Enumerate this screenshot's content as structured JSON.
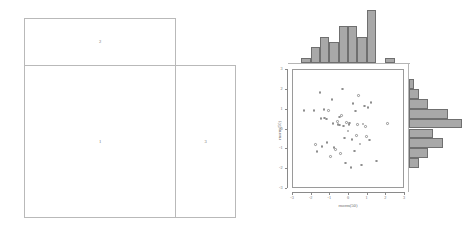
{
  "layout_diagram": {
    "title": "layout-matrix-diagram",
    "cells": [
      {
        "id": "1",
        "label": "1",
        "role": "scatter-region"
      },
      {
        "id": "2",
        "label": "2",
        "role": "top-histogram-region"
      },
      {
        "id": "3",
        "label": "3",
        "role": "right-histogram-region"
      }
    ],
    "border_color": "#b9b9b9",
    "label_color": "#6d6d6d"
  },
  "chart_data": {
    "type": "scatter",
    "title": "",
    "subtitle": "",
    "xlabel": "rnorm(50)",
    "ylabel": "rnorm(50)",
    "xlim": [
      -3,
      3
    ],
    "ylim": [
      -3,
      3
    ],
    "xticks": [
      "-3",
      "-2",
      "-1",
      "0",
      "1",
      "2",
      "3"
    ],
    "xtick_values": [
      -3,
      -2,
      -1,
      0,
      1,
      2,
      3
    ],
    "yticks": [
      "-3",
      "-2",
      "-1",
      "0",
      "1",
      "2",
      "3"
    ],
    "ytick_values": [
      -3,
      -2,
      -1,
      0,
      1,
      2,
      3
    ],
    "grid": false,
    "legend": null,
    "point_style": {
      "marker": "open-circle",
      "color": "#8e8e8e",
      "size": 2.6
    },
    "n_points": 50,
    "points": [
      [
        -2.42,
        0.96
      ],
      [
        -1.88,
        0.95
      ],
      [
        -1.78,
        -0.75
      ],
      [
        -1.72,
        -1.12
      ],
      [
        -1.55,
        1.88
      ],
      [
        -1.5,
        0.56
      ],
      [
        -1.44,
        -0.85
      ],
      [
        -1.33,
        1.02
      ],
      [
        -1.3,
        0.58
      ],
      [
        -1.22,
        0.52
      ],
      [
        -1.18,
        -0.66
      ],
      [
        -1.1,
        0.97
      ],
      [
        -0.98,
        -1.35
      ],
      [
        -0.9,
        1.52
      ],
      [
        -0.86,
        0.3
      ],
      [
        -0.8,
        -0.9
      ],
      [
        -0.72,
        -1.02
      ],
      [
        -0.62,
        0.4
      ],
      [
        -0.58,
        0.26
      ],
      [
        -0.52,
        0.22
      ],
      [
        -0.5,
        0.62
      ],
      [
        -0.46,
        -1.22
      ],
      [
        -0.4,
        0.7
      ],
      [
        -0.34,
        2.05
      ],
      [
        -0.3,
        0.18
      ],
      [
        -0.24,
        -0.42
      ],
      [
        -0.18,
        -1.68
      ],
      [
        -0.12,
        0.36
      ],
      [
        -0.06,
        -0.08
      ],
      [
        0.0,
        0.26
      ],
      [
        0.04,
        0.32
      ],
      [
        0.1,
        -1.92
      ],
      [
        0.16,
        -0.5
      ],
      [
        0.22,
        1.3
      ],
      [
        0.28,
        -1.08
      ],
      [
        0.34,
        0.94
      ],
      [
        0.4,
        -0.3
      ],
      [
        0.46,
        0.24
      ],
      [
        0.52,
        1.7
      ],
      [
        0.58,
        -0.74
      ],
      [
        0.66,
        -1.8
      ],
      [
        0.74,
        0.28
      ],
      [
        0.82,
        1.18
      ],
      [
        0.88,
        0.14
      ],
      [
        0.94,
        -0.34
      ],
      [
        1.02,
        1.1
      ],
      [
        1.1,
        -0.52
      ],
      [
        1.18,
        1.36
      ],
      [
        1.46,
        -1.58
      ],
      [
        2.06,
        0.3
      ]
    ],
    "marginal_top": {
      "type": "bar",
      "orientation": "vertical",
      "label": "x-marginal-histogram",
      "bin_edges": [
        -3.0,
        -2.5,
        -2.0,
        -1.5,
        -1.0,
        -0.5,
        0.0,
        0.5,
        1.0,
        1.5,
        2.0,
        2.5
      ],
      "categories": [
        "-3:-2.5",
        "-2.5:-2",
        "-2:-1.5",
        "-1.5:-1",
        "-1:-0.5",
        "-0.5:0",
        "0:0.5",
        "0.5:1",
        "1:1.5",
        "1.5:2",
        "2:2.5"
      ],
      "values": [
        0,
        1,
        3,
        5,
        4,
        7,
        7,
        5,
        10,
        0,
        1
      ],
      "ylim": [
        0,
        10
      ]
    },
    "marginal_right": {
      "type": "bar",
      "orientation": "horizontal",
      "label": "y-marginal-histogram",
      "bin_edges": [
        -2.0,
        -1.5,
        -1.0,
        -0.5,
        0.0,
        0.5,
        1.0,
        1.5,
        2.0,
        2.5
      ],
      "categories": [
        "2:2.5",
        "1.5:2",
        "1:1.5",
        "0.5:1",
        "0:0.5",
        "-0.5:0",
        "-1:-0.5",
        "-1.5:-1",
        "-2:-1.5"
      ],
      "values": [
        1,
        2,
        4,
        8,
        11,
        5,
        7,
        4,
        2
      ],
      "xlim": [
        0,
        11
      ]
    },
    "bar_style": {
      "fill": "#a8a8a8",
      "border": "#6f6f6f"
    },
    "axis_color": "#8a8a8a",
    "text_color": "#6a6a6a"
  }
}
